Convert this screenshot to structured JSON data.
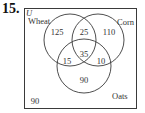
{
  "problem_number": "15.",
  "universe_label": "U",
  "sets": [
    {
      "name": "Wheat",
      "label": "Wheat"
    },
    {
      "name": "Corn",
      "label": "Corn"
    },
    {
      "name": "Oats",
      "label": "Oats"
    }
  ],
  "regions": {
    "wheat_only": "125",
    "wheat_corn_only": "25",
    "corn_only": "110",
    "all_three": "35",
    "wheat_oats_only": "15",
    "corn_oats_only": "10",
    "oats_only": "90",
    "outside": "90"
  },
  "colors": {
    "stroke": "#3a3a3a",
    "text": "#333333"
  }
}
